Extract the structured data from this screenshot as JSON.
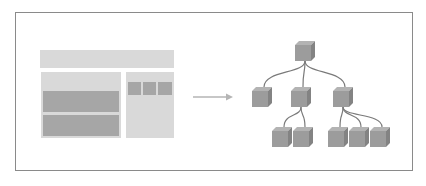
{
  "diagram": {
    "colors": {
      "frame_border": "#8a8a8a",
      "layout_light": "#d9d9d9",
      "layout_dark": "#a6a6a6",
      "arrow": "#b5b5b5",
      "cube_front": "#9c9c9c",
      "cube_top": "#b3b3b3",
      "cube_side": "#838383",
      "connector": "#7a7a7a"
    },
    "left_panel": {
      "label": "page layout wireframe",
      "blocks": [
        {
          "name": "header-bar",
          "x": 40,
          "y": 50,
          "w": 134,
          "h": 18,
          "tone": "light"
        },
        {
          "name": "main-column",
          "x": 41,
          "y": 72,
          "w": 80,
          "h": 66,
          "tone": "light"
        },
        {
          "name": "content-block-1",
          "x": 43,
          "y": 91,
          "w": 76,
          "h": 21,
          "tone": "dark"
        },
        {
          "name": "content-block-2",
          "x": 43,
          "y": 115,
          "w": 76,
          "h": 21,
          "tone": "dark"
        },
        {
          "name": "sidebar-column",
          "x": 126,
          "y": 72,
          "w": 48,
          "h": 66,
          "tone": "light"
        },
        {
          "name": "sidebar-tile-1",
          "x": 128,
          "y": 82,
          "w": 13,
          "h": 13,
          "tone": "dark"
        },
        {
          "name": "sidebar-tile-2",
          "x": 143,
          "y": 82,
          "w": 13,
          "h": 13,
          "tone": "dark"
        },
        {
          "name": "sidebar-tile-3",
          "x": 158,
          "y": 82,
          "w": 14,
          "h": 13,
          "tone": "dark"
        }
      ]
    },
    "arrow": {
      "x1": 193,
      "y1": 97,
      "x2": 233,
      "y2": 97,
      "direction": "right"
    },
    "tree": {
      "label": "component hierarchy",
      "nodes": [
        {
          "id": "root",
          "x": 295,
          "y": 41,
          "level": 0
        },
        {
          "id": "child-1",
          "x": 252,
          "y": 87,
          "level": 1
        },
        {
          "id": "child-2",
          "x": 291,
          "y": 87,
          "level": 1
        },
        {
          "id": "child-3",
          "x": 333,
          "y": 87,
          "level": 1
        },
        {
          "id": "grandchild-2-1",
          "x": 272,
          "y": 127,
          "level": 2
        },
        {
          "id": "grandchild-2-2",
          "x": 293,
          "y": 127,
          "level": 2
        },
        {
          "id": "grandchild-3-1",
          "x": 328,
          "y": 127,
          "level": 2
        },
        {
          "id": "grandchild-3-2",
          "x": 349,
          "y": 127,
          "level": 2
        },
        {
          "id": "grandchild-3-3",
          "x": 370,
          "y": 127,
          "level": 2
        }
      ],
      "edges": [
        {
          "from": "root",
          "to": "child-1"
        },
        {
          "from": "root",
          "to": "child-2"
        },
        {
          "from": "root",
          "to": "child-3"
        },
        {
          "from": "child-2",
          "to": "grandchild-2-1"
        },
        {
          "from": "child-2",
          "to": "grandchild-2-2"
        },
        {
          "from": "child-3",
          "to": "grandchild-3-1"
        },
        {
          "from": "child-3",
          "to": "grandchild-3-2"
        },
        {
          "from": "child-3",
          "to": "grandchild-3-3"
        }
      ],
      "cube_size": 20
    }
  }
}
